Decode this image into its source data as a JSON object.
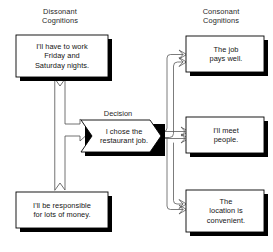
{
  "diagram": {
    "background_color": "#ffffff",
    "box_fill_color": "#ffffff",
    "box_border_color": "#000000",
    "shadow_color": "#000000",
    "connector_color": "#555555",
    "text_color": "#141414"
  },
  "headers": {
    "left": "Dissonant\nCognitions",
    "right": "Consonant\nCognitions"
  },
  "decision": {
    "caption": "Decision",
    "text": "I chose the\nrestaurant job."
  },
  "dissonant_cognitions": [
    {
      "id": "work-nights",
      "text": "I'll have to work\nFriday and\nSaturday nights."
    },
    {
      "id": "responsible-money",
      "text": "I'll be responsible\nfor lots of money."
    }
  ],
  "consonant_cognitions": [
    {
      "id": "pays-well",
      "text": "The job\npays well."
    },
    {
      "id": "meet-people",
      "text": "I'll meet\npeople."
    },
    {
      "id": "location-convenient",
      "text": "The\nlocation is\nconvenient."
    }
  ],
  "connectors": [
    {
      "id": "decision-to-work-nights",
      "from": "decision",
      "to": "work-nights",
      "style": "block-arrow"
    },
    {
      "id": "decision-to-responsible-money",
      "from": "decision",
      "to": "responsible-money",
      "style": "block-arrow"
    },
    {
      "id": "decision-to-pays-well",
      "from": "decision",
      "to": "pays-well",
      "style": "line-arrow"
    },
    {
      "id": "decision-to-meet-people",
      "from": "decision",
      "to": "meet-people",
      "style": "line-arrow"
    },
    {
      "id": "decision-to-location-convenient",
      "from": "decision",
      "to": "location-convenient",
      "style": "line-arrow"
    }
  ]
}
